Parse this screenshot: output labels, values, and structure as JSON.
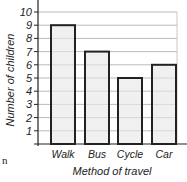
{
  "chart_data": {
    "type": "bar",
    "title": "",
    "categories": [
      "Walk",
      "Bus",
      "Cycle",
      "Car"
    ],
    "values": [
      9,
      7,
      5,
      6
    ],
    "xlabel": "Method of travel",
    "ylabel": "Number of children",
    "ylim": [
      0,
      10
    ],
    "yticks": [
      1,
      2,
      3,
      4,
      5,
      6,
      7,
      8,
      9,
      10
    ],
    "grid": true,
    "bar_fill": "#f0f0f0",
    "bar_stroke": "#222222"
  },
  "fragment_text": "n"
}
